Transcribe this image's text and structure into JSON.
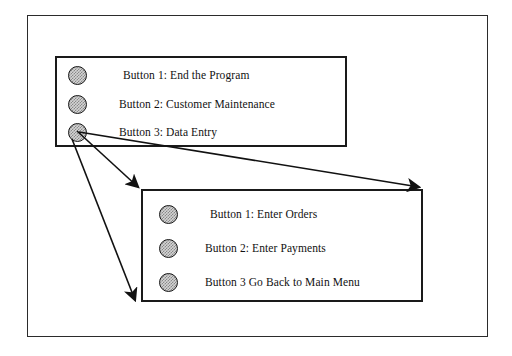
{
  "diagram": {
    "background_color": "#ffffff",
    "line_color": "#1a1a1a",
    "button_fill_color": "#d4d4d4"
  },
  "main_menu": {
    "name": "Main Menu panel",
    "buttons": [
      {
        "icon": "radio-button-icon",
        "label": "Button 1:  End the Program"
      },
      {
        "icon": "radio-button-icon",
        "label": "Button 2:  Customer Maintenance"
      },
      {
        "icon": "radio-button-icon",
        "label": "Button 3:  Data Entry"
      }
    ]
  },
  "data_entry_menu": {
    "name": "Data Entry panel",
    "buttons": [
      {
        "icon": "radio-button-icon",
        "label": "Button 1:  Enter Orders"
      },
      {
        "icon": "radio-button-icon",
        "label": "Button 2:  Enter Payments"
      },
      {
        "icon": "radio-button-icon",
        "label": "Button 3 Go Back to Main Menu"
      }
    ]
  },
  "connectors": [
    {
      "name": "arrow-to-subpanel-topleft",
      "from": [
        77,
        132
      ],
      "to": [
        140,
        189
      ]
    },
    {
      "name": "arrow-to-subpanel-topright",
      "from": [
        79,
        133
      ],
      "to": [
        421,
        188
      ]
    },
    {
      "name": "arrow-to-subpanel-bottomleft",
      "from": [
        73,
        139
      ],
      "to": [
        137,
        302
      ]
    }
  ]
}
